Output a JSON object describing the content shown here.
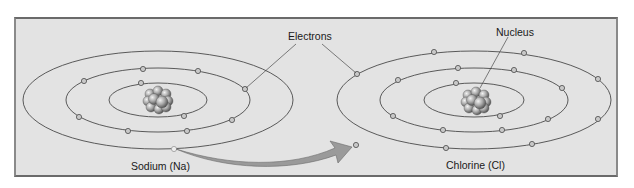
{
  "diagram": {
    "labels": {
      "electrons": "Electrons",
      "nucleus": "Nucleus",
      "sodium": "Sodium (Na)",
      "chlorine": "Chlorine (Cl)"
    },
    "atoms": [
      {
        "name": "Sodium (Na)",
        "shells": [
          2,
          8,
          1
        ]
      },
      {
        "name": "Chlorine (Cl)",
        "shells": [
          2,
          8,
          7
        ]
      }
    ],
    "arrow": "electron transfer from sodium outer shell to chlorine outer shell",
    "colors": {
      "background": "#e3e3e3",
      "orbit": "#4a4a4a",
      "electron_fill": "#c8c8c8",
      "arrow_fill": "#9a9a9a",
      "nucleus": "#9c9c9c"
    }
  }
}
